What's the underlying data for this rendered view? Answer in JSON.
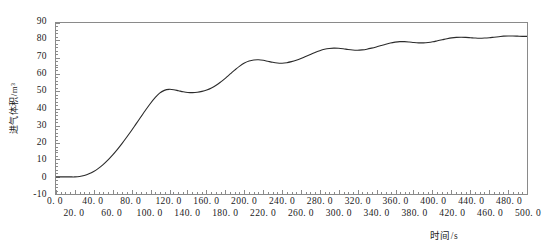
{
  "chart_data": {
    "type": "line",
    "title": "",
    "xlabel": "时间/s",
    "ylabel": "进气体积/m³",
    "xlim": [
      0,
      500
    ],
    "ylim": [
      -10,
      90
    ],
    "grid": false,
    "legend": null,
    "x_major_step": 20,
    "x_minor_step": 5,
    "y_major_step": 10,
    "y_minor_step": 2,
    "line_color": "#2b2b2b",
    "frame_color": "#8a8a8a",
    "x_tick_labels": [
      "0. 0",
      "20. 0",
      "40. 0",
      "60. 0",
      "80. 0",
      "100. 0",
      "120. 0",
      "140. 0",
      "160. 0",
      "180. 0",
      "200. 0",
      "220. 0",
      "240. 0",
      "260. 0",
      "280. 0",
      "300. 0",
      "320. 0",
      "340. 0",
      "360. 0",
      "380. 0",
      "400. 0",
      "420. 0",
      "440. 0",
      "460. 0",
      "480. 0",
      "500. 0"
    ],
    "x_tick_values": [
      0,
      20,
      40,
      60,
      80,
      100,
      120,
      140,
      160,
      180,
      200,
      220,
      240,
      260,
      280,
      300,
      320,
      340,
      360,
      380,
      400,
      420,
      440,
      460,
      480,
      500
    ],
    "y_tick_labels": [
      "90",
      "80",
      "70",
      "60",
      "50",
      "40",
      "30",
      "20",
      "10",
      "0",
      "-10"
    ],
    "y_tick_values": [
      90,
      80,
      70,
      60,
      50,
      40,
      30,
      20,
      10,
      0,
      -10
    ],
    "series": [
      {
        "name": "进气体积",
        "x": [
          0,
          5,
          10,
          15,
          20,
          25,
          30,
          35,
          40,
          45,
          50,
          55,
          60,
          65,
          70,
          75,
          80,
          85,
          90,
          95,
          100,
          105,
          110,
          115,
          120,
          125,
          130,
          135,
          140,
          145,
          150,
          155,
          160,
          165,
          170,
          175,
          180,
          185,
          190,
          195,
          200,
          205,
          210,
          215,
          220,
          225,
          230,
          235,
          240,
          245,
          250,
          255,
          260,
          265,
          270,
          275,
          280,
          285,
          290,
          295,
          300,
          305,
          310,
          315,
          320,
          325,
          330,
          335,
          340,
          345,
          350,
          355,
          360,
          365,
          370,
          375,
          380,
          385,
          390,
          395,
          400,
          405,
          410,
          415,
          420,
          425,
          430,
          435,
          440,
          445,
          450,
          455,
          460,
          465,
          470,
          475,
          480,
          485,
          490,
          495,
          500
        ],
        "y": [
          0.0,
          0.0,
          0.0,
          0.0,
          0.0,
          0.2,
          0.8,
          1.8,
          3.2,
          5.0,
          7.2,
          9.8,
          12.8,
          16.0,
          19.5,
          23.2,
          27.0,
          31.0,
          35.0,
          39.0,
          42.8,
          46.2,
          49.0,
          50.6,
          51.2,
          51.0,
          50.4,
          49.8,
          49.4,
          49.3,
          49.5,
          50.0,
          50.8,
          52.0,
          53.6,
          55.6,
          57.8,
          60.2,
          62.6,
          64.8,
          66.6,
          67.8,
          68.4,
          68.5,
          68.2,
          67.6,
          67.0,
          66.6,
          66.5,
          66.8,
          67.4,
          68.2,
          69.2,
          70.4,
          71.6,
          72.8,
          73.8,
          74.6,
          75.1,
          75.3,
          75.2,
          74.9,
          74.5,
          74.2,
          74.1,
          74.3,
          74.7,
          75.3,
          76.0,
          76.8,
          77.6,
          78.3,
          78.8,
          79.1,
          79.1,
          78.9,
          78.6,
          78.4,
          78.4,
          78.6,
          79.0,
          79.6,
          80.2,
          80.8,
          81.3,
          81.6,
          81.7,
          81.6,
          81.4,
          81.2,
          81.1,
          81.2,
          81.4,
          81.7,
          82.0,
          82.3,
          82.4,
          82.4,
          82.3,
          82.2,
          82.2
        ]
      }
    ]
  }
}
